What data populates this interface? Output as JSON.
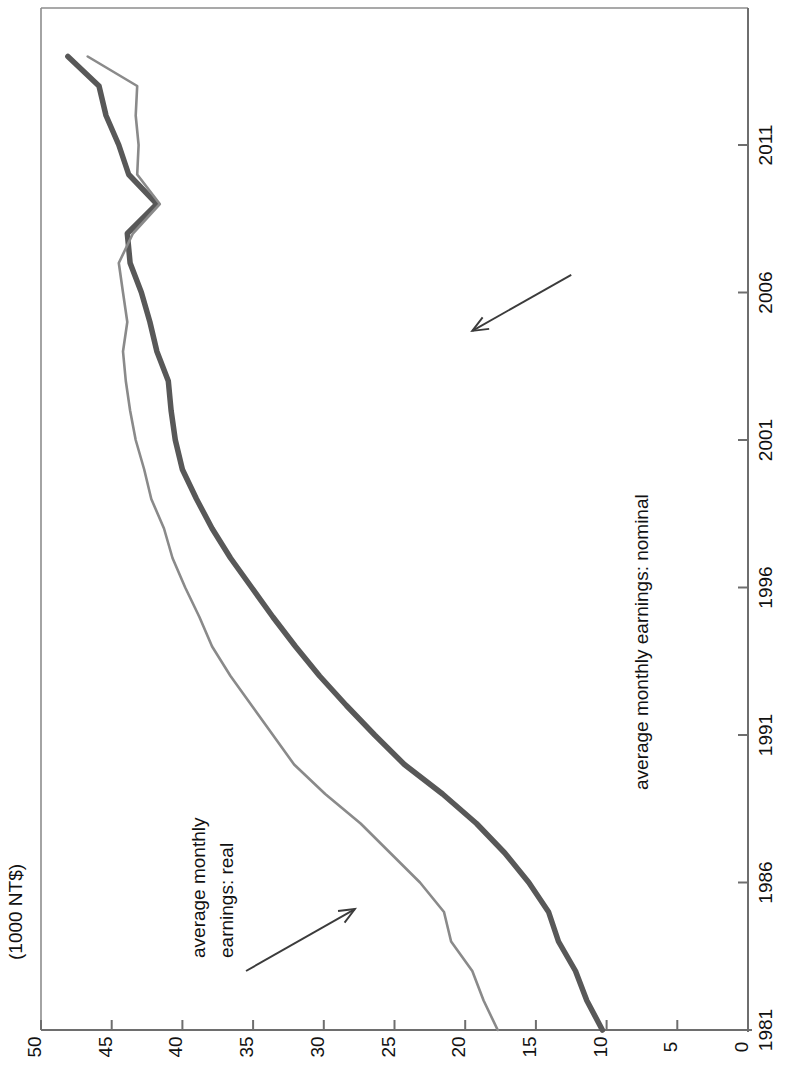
{
  "chart_data": {
    "type": "line",
    "title": "",
    "orientation": "rotated-90",
    "xlabel": "",
    "ylabel": "(1000 NT$)",
    "grid": false,
    "legend": "none-annotations",
    "xlim": [
      1981,
      2014
    ],
    "ylim": [
      0,
      50
    ],
    "x_ticks": [
      1981,
      1986,
      1991,
      1996,
      2001,
      2006,
      2011
    ],
    "y_ticks": [
      0,
      5,
      10,
      15,
      20,
      25,
      30,
      35,
      40,
      45,
      50
    ],
    "x": [
      1981,
      1982,
      1983,
      1984,
      1985,
      1986,
      1987,
      1988,
      1989,
      1990,
      1991,
      1992,
      1993,
      1994,
      1995,
      1996,
      1997,
      1998,
      1999,
      2000,
      2001,
      2002,
      2003,
      2004,
      2005,
      2006,
      2007,
      2008,
      2009,
      2010,
      2011,
      2012,
      2013,
      2014
    ],
    "series": [
      {
        "name": "average monthly earnings: nominal",
        "color": "#585858",
        "width": 5.5,
        "values": [
          10.3,
          11.4,
          12.2,
          13.4,
          14.1,
          15.5,
          17.2,
          19.2,
          21.6,
          24.3,
          26.4,
          28.4,
          30.3,
          32.0,
          33.6,
          35.1,
          36.6,
          37.9,
          39.0,
          40.0,
          40.5,
          40.8,
          41.0,
          41.8,
          42.3,
          42.9,
          43.7,
          43.9,
          41.8,
          43.8,
          44.5,
          45.4,
          45.9,
          48.1
        ]
      },
      {
        "name": "average monthly earnings: real",
        "color": "#8a8a8a",
        "width": 2.6,
        "values": [
          17.7,
          18.7,
          19.5,
          21.0,
          21.5,
          23.2,
          25.3,
          27.4,
          29.9,
          32.1,
          33.6,
          35.1,
          36.6,
          37.9,
          38.8,
          39.8,
          40.7,
          41.3,
          42.2,
          42.7,
          43.3,
          43.7,
          44.0,
          44.2,
          43.9,
          44.2,
          44.5,
          43.5,
          41.6,
          43.2,
          43.1,
          43.3,
          43.2,
          46.7
        ]
      }
    ],
    "annotations": [
      {
        "name": "nominal-annotation",
        "text": "average monthly earnings: nominal",
        "arrow_from": [
          2006.6,
          12.5
        ],
        "arrow_to": [
          2004.7,
          19.5
        ]
      },
      {
        "name": "real-annotation",
        "text_line1": "average monthly",
        "text_line2": "earnings: real",
        "arrow_from": [
          1983.0,
          35.5
        ],
        "arrow_to": [
          1985.1,
          27.8
        ]
      }
    ]
  },
  "axes": {
    "value_axis_label": "(1000 NT$)",
    "value_ticks": [
      "50",
      "45",
      "40",
      "35",
      "30",
      "25",
      "20",
      "15",
      "10",
      "5",
      "0"
    ],
    "time_ticks": [
      "1981",
      "1986",
      "1991",
      "1996",
      "2001",
      "2006",
      "2011"
    ]
  },
  "annotations": {
    "nominal": "average monthly earnings: nominal",
    "real_line1": "average monthly",
    "real_line2": "earnings: real"
  },
  "colors": {
    "nominal_line": "#585858",
    "real_line": "#8a8a8a",
    "axis": "#6e6e6e",
    "text": "#111111"
  }
}
